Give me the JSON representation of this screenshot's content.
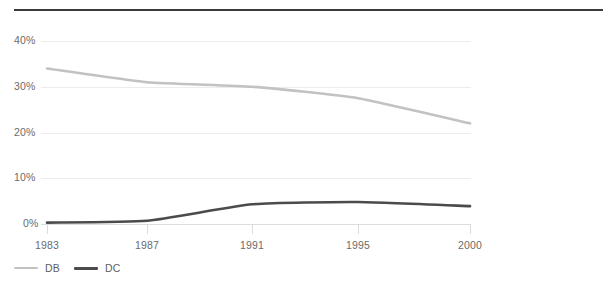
{
  "chart_data": {
    "type": "line",
    "title": "",
    "subtitle": "",
    "xlabel": "",
    "ylabel": "",
    "x": [
      "1983",
      "1987",
      "1991",
      "1995",
      "2000"
    ],
    "categories": [
      "1983",
      "1987",
      "1991",
      "1995",
      "2000"
    ],
    "series": [
      {
        "name": "DB",
        "color": "#c2c2c2",
        "values": [
          34,
          31,
          30,
          27.5,
          22
        ]
      },
      {
        "name": "DC",
        "color": "#4b4b4b",
        "values": [
          0.3,
          0.7,
          4.3,
          4.8,
          3.9
        ]
      }
    ],
    "ylim": [
      0,
      40
    ],
    "yticks": [
      0,
      10,
      20,
      30,
      40
    ],
    "ytick_labels": [
      "0%",
      "10%",
      "20%",
      "30%",
      "40%"
    ],
    "xtick_labels": [
      "1983",
      "1987",
      "1991",
      "1995",
      "2000"
    ],
    "grid": true,
    "grid_axis": "y",
    "legend_position": "bottom-left",
    "value_suffix": "%"
  },
  "axes": {
    "y_labels": [
      "40%",
      "30%",
      "20%",
      "10%",
      "0%"
    ],
    "x_labels": [
      "1983",
      "1987",
      "1991",
      "1995",
      "2000"
    ]
  },
  "legend": {
    "items": [
      {
        "label": "DB",
        "color": "#c2c2c2"
      },
      {
        "label": "DC",
        "color": "#4b4b4b"
      }
    ]
  },
  "style": {
    "top_rule_color": "#3b3b3b",
    "grid_color": "#ececec",
    "text_color": "#6b6b6b",
    "background": "#ffffff"
  }
}
